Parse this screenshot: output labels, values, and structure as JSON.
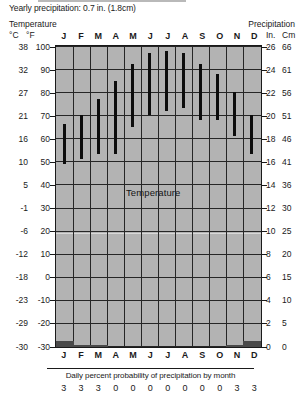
{
  "header": {
    "yearly_precipitation": "Yearly precipitation: 0.7 in. (1.8cm)",
    "left_axis_title": "Temperature",
    "left_unit_primary": "°C",
    "left_unit_secondary": "°F",
    "right_axis_title": "Precipitation",
    "right_unit_primary": "In.",
    "right_unit_secondary": "Cm"
  },
  "plot_labels": {
    "temperature": "Temperature",
    "precipitation": "Precipitation"
  },
  "footer": {
    "caption": "Daily percent probability of precipitation by month"
  },
  "chart_data": {
    "type": "bar",
    "xlabel": "",
    "ylabel": "Temperature",
    "grid": true,
    "legend_position": "inline-annotation",
    "categories": [
      "J",
      "F",
      "M",
      "A",
      "M",
      "J",
      "J",
      "A",
      "S",
      "O",
      "N",
      "D"
    ],
    "month_names": [
      "January",
      "February",
      "March",
      "April",
      "May",
      "June",
      "July",
      "August",
      "September",
      "October",
      "November",
      "December"
    ],
    "left_axis": {
      "label": "Temperature",
      "unit_primary": "°C",
      "unit_secondary": "°F",
      "ylim_f": [
        -30,
        100
      ],
      "ticks_f": [
        100,
        90,
        80,
        70,
        60,
        50,
        40,
        30,
        20,
        10,
        0,
        -10,
        -20,
        -30
      ],
      "ticks_c": [
        38,
        32,
        27,
        21,
        16,
        10,
        5,
        -1,
        -6,
        -12,
        -18,
        -23,
        -29,
        -30
      ]
    },
    "right_axis": {
      "label": "Precipitation",
      "unit_primary": "In.",
      "unit_secondary": "Cm",
      "ylim_in": [
        0,
        26
      ],
      "ticks_in": [
        26,
        24,
        22,
        20,
        18,
        16,
        14,
        12,
        10,
        8,
        6,
        4,
        2,
        0
      ],
      "ticks_cm": [
        66,
        61,
        56,
        51,
        46,
        41,
        36,
        30,
        25,
        20,
        15,
        10,
        5,
        0
      ]
    },
    "series": [
      {
        "name": "Temperature high (°F)",
        "values": [
          66,
          70,
          77,
          85,
          92,
          97,
          98,
          97,
          92,
          88,
          80,
          70
        ]
      },
      {
        "name": "Temperature low (°F)",
        "values": [
          49,
          51,
          53,
          53,
          65,
          70,
          72,
          73,
          68,
          68,
          61,
          53
        ]
      },
      {
        "name": "Precipitation (in.)",
        "values": [
          0.3,
          0.1,
          0.1,
          0.0,
          0.0,
          0.0,
          0.0,
          0.0,
          0.0,
          0.0,
          0.1,
          0.3
        ]
      },
      {
        "name": "Daily percent probability of precipitation",
        "values": [
          3,
          3,
          3,
          0,
          0,
          0,
          0,
          0,
          0,
          0,
          3,
          3
        ]
      }
    ],
    "annotations": [
      {
        "text": "Temperature",
        "x": "A-M",
        "y_f": 44
      },
      {
        "text": "Precipitation",
        "x": "A-M",
        "y_f": -24
      }
    ],
    "precip_probability_row": [
      "3",
      "3",
      "3",
      "0",
      "0",
      "0",
      "0",
      "0",
      "0",
      "0",
      "3",
      "3"
    ]
  }
}
